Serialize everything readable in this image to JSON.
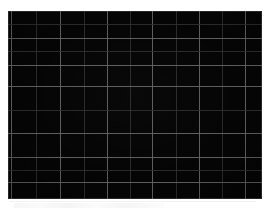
{
  "canvas": {
    "width": 269,
    "height": 212,
    "page_background": "#ffffff"
  },
  "panel": {
    "name": "grid-panel",
    "background_color": "#050505",
    "border_color": "#787878",
    "left": 8,
    "top": 11,
    "width": 254,
    "height": 188,
    "major_gridline_color": "#6d6d6d",
    "minor_gridline_color": "#333333"
  },
  "annotations": {
    "bottom_ghost_line_color": "#f2f2f2",
    "visible_text": ""
  },
  "chart_data": {
    "type": "table",
    "title": "",
    "subtitle": "",
    "xlabel": "",
    "ylabel": "",
    "grid": true,
    "legend": null,
    "legend_position": "none",
    "tick_labels_x": [],
    "tick_labels_y": [],
    "series": [],
    "values": [],
    "note": "Underexposed / near-black panel: only a faint grey grid is visible over a black field. No data marks, labels, ticks, legend or axis text are legible in the pixels.",
    "grid_vertical_major_x": [
      11,
      60,
      107,
      152,
      199,
      245
    ],
    "grid_vertical_minor_x": [
      36,
      84,
      130,
      176,
      222
    ],
    "grid_horizontal_major_y": [
      38,
      65,
      86,
      133,
      157,
      182
    ],
    "grid_horizontal_minor_y": [
      24,
      51,
      110,
      170
    ],
    "columns": 11,
    "rows": 10
  }
}
